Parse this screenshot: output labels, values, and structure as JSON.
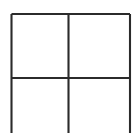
{
  "figure": {
    "type": "line-drawing",
    "background_color": "#ffffff",
    "line_color": "#2b2b2b",
    "line_width_px": 2,
    "canvas": {
      "width": 136,
      "height": 133
    },
    "grid": {
      "rows": 2,
      "columns": 2,
      "bottom_edge_visible": false
    },
    "geometry": {
      "left_x": 11.5,
      "mid_x": 68.5,
      "right_x": 130.0,
      "top_y": 14.0,
      "mid_y": 78.0,
      "bottom_y": 133.0
    },
    "segments": [
      {
        "name": "top-edge",
        "orientation": "horizontal",
        "x1": 11.5,
        "y1": 14.0,
        "x2": 130.0,
        "y2": 14.0
      },
      {
        "name": "middle-rail",
        "orientation": "horizontal",
        "x1": 11.5,
        "y1": 78.0,
        "x2": 130.0,
        "y2": 78.0
      },
      {
        "name": "left-edge",
        "orientation": "vertical",
        "x1": 11.5,
        "y1": 14.0,
        "x2": 11.5,
        "y2": 133.0
      },
      {
        "name": "center-mullion",
        "orientation": "vertical",
        "x1": 68.5,
        "y1": 14.0,
        "x2": 68.5,
        "y2": 133.0
      },
      {
        "name": "right-edge",
        "orientation": "vertical",
        "x1": 130.0,
        "y1": 14.0,
        "x2": 130.0,
        "y2": 133.0
      }
    ],
    "panes": [
      {
        "name": "pane-top-left",
        "x": 13.0,
        "y": 15.5,
        "width": 54.0,
        "height": 61.5,
        "fill": "#ffffff",
        "content": ""
      },
      {
        "name": "pane-top-right",
        "x": 70.0,
        "y": 15.5,
        "width": 59.0,
        "height": 61.5,
        "fill": "#ffffff",
        "content": ""
      },
      {
        "name": "pane-bottom-left",
        "x": 13.0,
        "y": 79.5,
        "width": 54.0,
        "height": 53.5,
        "fill": "#ffffff",
        "content": ""
      },
      {
        "name": "pane-bottom-right",
        "x": 70.0,
        "y": 79.5,
        "width": 59.0,
        "height": 53.5,
        "fill": "#ffffff",
        "content": ""
      }
    ]
  }
}
